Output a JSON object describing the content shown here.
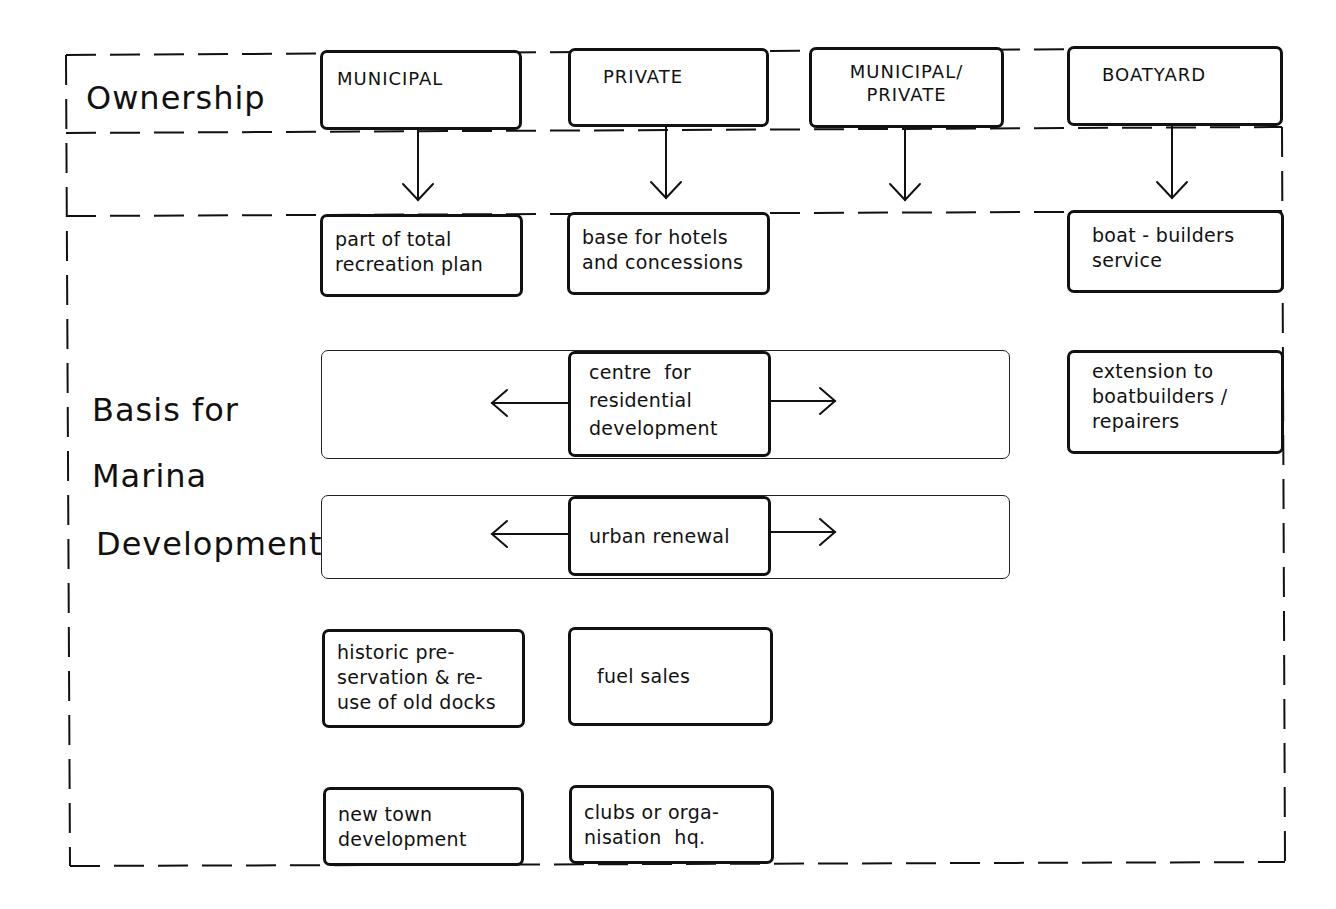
{
  "diagram": {
    "type": "flowchart",
    "row_labels": {
      "ownership": "Ownership",
      "basis_line1": "Basis for",
      "basis_line2": "Marina",
      "basis_line3": "Development"
    },
    "ownership_types": [
      {
        "id": "municipal",
        "label": "MUNICIPAL"
      },
      {
        "id": "private",
        "label": "PRIVATE"
      },
      {
        "id": "municipal_private",
        "label_line1": "MUNICIPAL/",
        "label_line2": "PRIVATE"
      },
      {
        "id": "boatyard",
        "label": "BOATYARD"
      }
    ],
    "bases": {
      "recreation_plan": {
        "line1": "part of total",
        "line2": "recreation plan",
        "column": "municipal"
      },
      "hotels": {
        "line1": "base for hotels",
        "line2": "and concessions",
        "column": "private"
      },
      "boat_builders": {
        "line1": "boat - builders",
        "line2": "service",
        "column": "boatyard"
      },
      "extension": {
        "line1": "extension to",
        "line2": "boatbuilders /",
        "line3": "repairers",
        "column": "boatyard"
      },
      "residential": {
        "line1": "centre  for",
        "line2": "residential",
        "line3": "development",
        "spans": [
          "municipal",
          "private",
          "municipal_private"
        ]
      },
      "urban_renewal": {
        "label": "urban renewal",
        "spans": [
          "municipal",
          "private",
          "municipal_private"
        ]
      },
      "historic": {
        "line1": "historic pre-",
        "line2": "servation & re-",
        "line3": "use of old docks",
        "column": "municipal"
      },
      "fuel": {
        "label": "fuel sales",
        "column": "private"
      },
      "new_town": {
        "line1": "new town",
        "line2": "development",
        "column": "municipal"
      },
      "clubs": {
        "line1": "clubs or orga-",
        "line2": "nisation  hq.",
        "column": "private"
      }
    },
    "colors": {
      "ink": "#111111",
      "background": "#ffffff"
    }
  }
}
